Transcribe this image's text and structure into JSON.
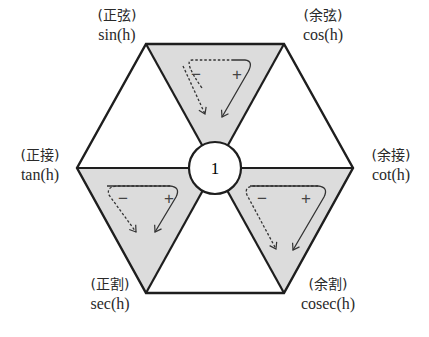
{
  "diagram": {
    "title": "",
    "center": {
      "label": "1"
    },
    "vertices": [
      {
        "id": "sin",
        "kanji": "(正弦)",
        "func": "sin(h)"
      },
      {
        "id": "cos",
        "kanji": "(余弦)",
        "func": "cos(h)"
      },
      {
        "id": "tan",
        "kanji": "(正接)",
        "func": "tan(h)"
      },
      {
        "id": "cot",
        "kanji": "(余接)",
        "func": "cot(h)"
      },
      {
        "id": "sec",
        "kanji": "(正割)",
        "func": "sec(h)"
      },
      {
        "id": "cosec",
        "kanji": "(余割)",
        "func": "cosec(h)"
      }
    ],
    "shaded_triangles": [
      {
        "position": "top",
        "minus": "−",
        "plus": "+"
      },
      {
        "position": "lower-left",
        "minus": "−",
        "plus": "+"
      },
      {
        "position": "lower-right",
        "minus": "−",
        "plus": "+"
      }
    ],
    "colors": {
      "shade": "#dcdcdc",
      "stroke": "#1e1e1e",
      "background": "#ffffff"
    }
  }
}
